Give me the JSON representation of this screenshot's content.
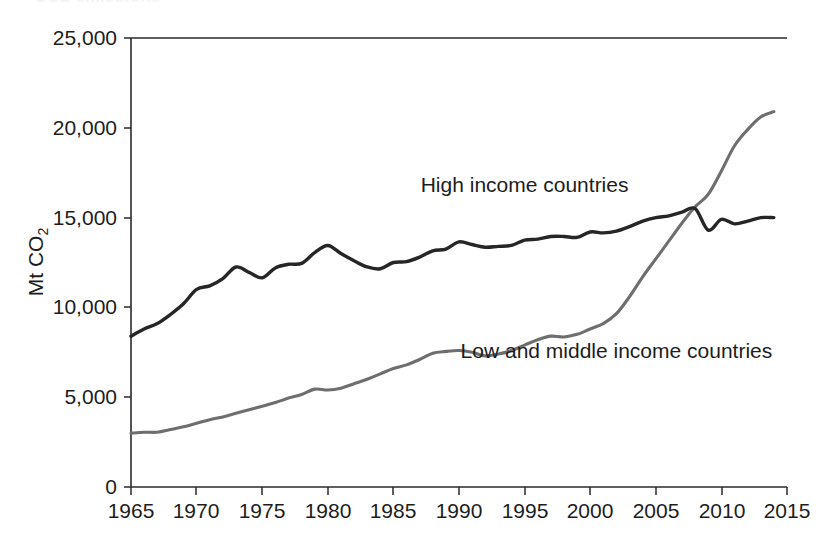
{
  "figure": {
    "clipped_title_remnant": "CO2 emissions",
    "background_color": "#ffffff"
  },
  "chart_data": {
    "type": "line",
    "title": "",
    "xlabel": "",
    "ylabel": "Mt CO2",
    "ylabel_main": "Mt CO",
    "ylabel_subscript": "2",
    "xlim": [
      1965,
      2015
    ],
    "ylim": [
      0,
      25000
    ],
    "grid": false,
    "legend_position": "inline-annotations",
    "y_ticks": [
      0,
      5000,
      10000,
      15000,
      20000,
      25000
    ],
    "y_tick_labels": [
      "0",
      "5,000",
      "10,000",
      "15,000",
      "20,000",
      "25,000"
    ],
    "x_ticks": [
      1965,
      1970,
      1975,
      1980,
      1985,
      1990,
      1995,
      2000,
      2005,
      2010,
      2015
    ],
    "x_tick_labels": [
      "1965",
      "1970",
      "1975",
      "1980",
      "1985",
      "1990",
      "1995",
      "2000",
      "2005",
      "2010",
      "2015"
    ],
    "x": [
      1965,
      1966,
      1967,
      1968,
      1969,
      1970,
      1971,
      1972,
      1973,
      1974,
      1975,
      1976,
      1977,
      1978,
      1979,
      1980,
      1981,
      1982,
      1983,
      1984,
      1985,
      1986,
      1987,
      1988,
      1989,
      1990,
      1991,
      1992,
      1993,
      1994,
      1995,
      1996,
      1997,
      1998,
      1999,
      2000,
      2001,
      2002,
      2003,
      2004,
      2005,
      2006,
      2007,
      2008,
      2009,
      2010,
      2011,
      2012,
      2013,
      2014
    ],
    "series": [
      {
        "name": "High income countries",
        "color": "#262626",
        "annotation_label": "High income countries",
        "values": [
          8400,
          8800,
          9100,
          9600,
          10200,
          11000,
          11200,
          11600,
          12250,
          11950,
          11650,
          12200,
          12400,
          12450,
          13050,
          13450,
          13000,
          12600,
          12250,
          12150,
          12500,
          12550,
          12800,
          13150,
          13250,
          13650,
          13500,
          13350,
          13400,
          13450,
          13750,
          13800,
          13950,
          13950,
          13900,
          14200,
          14150,
          14250,
          14500,
          14800,
          15000,
          15100,
          15300,
          15500,
          14300,
          14900,
          14650,
          14800,
          15000,
          15000
        ]
      },
      {
        "name": "Low and middle income countries",
        "color": "#6e6e6e",
        "annotation_label": "Low and middle income countries",
        "values": [
          3000,
          3050,
          3050,
          3200,
          3350,
          3550,
          3750,
          3900,
          4100,
          4300,
          4500,
          4700,
          4950,
          5150,
          5450,
          5400,
          5500,
          5750,
          6000,
          6300,
          6600,
          6800,
          7100,
          7450,
          7550,
          7600,
          7500,
          7300,
          7400,
          7600,
          7900,
          8200,
          8400,
          8350,
          8500,
          8800,
          9100,
          9650,
          10600,
          11700,
          12700,
          13700,
          14700,
          15600,
          16300,
          17600,
          19000,
          19900,
          20600,
          20900
        ]
      }
    ],
    "annotations": [
      {
        "text": "High income countries",
        "x_year": 1995,
        "y_value": 16400
      },
      {
        "text": "Low and middle income countries",
        "x_year": 2002,
        "y_value": 7200
      }
    ]
  }
}
